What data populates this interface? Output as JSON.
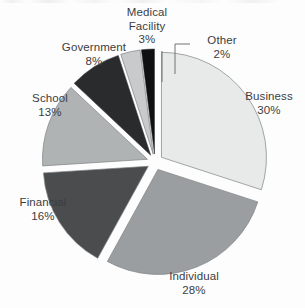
{
  "chart_data": {
    "type": "pie",
    "title": "",
    "subtitle": "",
    "xlabel": "",
    "ylabel": "",
    "legend_position": "none",
    "grid": false,
    "exploded": true,
    "units": "percent",
    "total": 100,
    "start_angle_deg": 0,
    "direction": "clockwise",
    "categories": [
      "Business",
      "Individual",
      "Financial",
      "School",
      "Government",
      "Medical Facility",
      "Other"
    ],
    "values": [
      30,
      28,
      16,
      13,
      8,
      3,
      2
    ],
    "slices": [
      {
        "id": "business",
        "label": "Business",
        "value": 30,
        "value_text": "30%",
        "color": "#e8eaea",
        "start_deg": 0,
        "end_deg": 108,
        "label_position": "right",
        "leader_line": false
      },
      {
        "id": "individual",
        "label": "Individual",
        "value": 28,
        "value_text": "28%",
        "color": "#9a9ea0",
        "start_deg": 108,
        "end_deg": 208.8,
        "label_position": "bottom",
        "leader_line": false
      },
      {
        "id": "financial",
        "label": "Financial",
        "value": 16,
        "value_text": "16%",
        "color": "#4a4c4e",
        "start_deg": 208.8,
        "end_deg": 266.4,
        "label_position": "left",
        "leader_line": false
      },
      {
        "id": "school",
        "label": "School",
        "value": 13,
        "value_text": "13%",
        "color": "#b0b3b3",
        "start_deg": 266.4,
        "end_deg": 313.2,
        "label_position": "upper-left",
        "leader_line": false
      },
      {
        "id": "government",
        "label": "Government",
        "value": 8,
        "value_text": "8%",
        "color": "#2a2b2d",
        "start_deg": 313.2,
        "end_deg": 342,
        "label_position": "top-left",
        "leader_line": false
      },
      {
        "id": "medical-facility",
        "label": "Medical Facility",
        "label_line1": "Medical",
        "label_line2": "Facility",
        "value": 3,
        "value_text": "3%",
        "color": "#c8cacb",
        "start_deg": 342,
        "end_deg": 352.8,
        "label_position": "top",
        "leader_line": true
      },
      {
        "id": "other",
        "label": "Other",
        "value": 2,
        "value_text": "2%",
        "color": "#0f1011",
        "start_deg": 352.8,
        "end_deg": 360,
        "label_position": "top-right",
        "leader_line": true
      }
    ]
  },
  "labels": {
    "business": {
      "name": "Business",
      "pct": "30%"
    },
    "individual": {
      "name": "Individual",
      "pct": "28%"
    },
    "financial": {
      "name": "Financial",
      "pct": "16%"
    },
    "school": {
      "name": "School",
      "pct": "13%"
    },
    "government": {
      "name": "Government",
      "pct": "8%"
    },
    "medical": {
      "name_line1": "Medical",
      "name_line2": "Facility",
      "pct": "3%"
    },
    "other": {
      "name": "Other",
      "pct": "2%"
    }
  },
  "colors": {
    "background": "#fdfdfd",
    "text": "#3b3d3f",
    "outline_light": "#7e8284",
    "outline_dark": "#2e3032",
    "leader_line": "#6e7274"
  }
}
